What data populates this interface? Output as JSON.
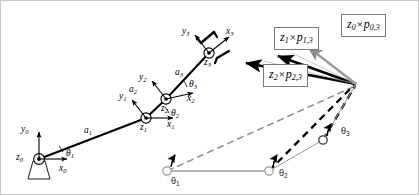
{
  "figure": {
    "width": 419,
    "height": 195,
    "background": "#ffffff",
    "border_color": "#c8c8c8"
  },
  "colors": {
    "link": "#000000",
    "axis": "#000000",
    "dashed_gray": "#8c8c8c",
    "dashed_black": "#000000",
    "box_border": "#7a7a7a",
    "joint_fill_open": "#ffffff",
    "joint_fill_solid": "#000000",
    "lower_chain": "#9a9a9a",
    "text": "#000000"
  },
  "frames": [
    {
      "name": "frame-0",
      "origin_label": "z",
      "origin_sub": "0",
      "x_label": "x",
      "x_sub": "0",
      "y_label": "y",
      "y_sub": "0",
      "z_symbol": "out-of-page",
      "mounted": true
    },
    {
      "name": "frame-1",
      "origin_label": "z",
      "origin_sub": "1",
      "x_label": "x",
      "x_sub": "1",
      "y_label": "y",
      "y_sub": "1",
      "z_symbol": "out-of-page",
      "mounted": false
    },
    {
      "name": "frame-2",
      "origin_label": "z",
      "origin_sub": "2",
      "x_label": "x",
      "x_sub": "2",
      "y_label": "y",
      "y_sub": "2",
      "z_symbol": "out-of-page",
      "mounted": false
    },
    {
      "name": "frame-3",
      "origin_label": "z",
      "origin_sub": "3",
      "x_label": "x",
      "x_sub": "3",
      "y_label": "y",
      "y_sub": "3",
      "z_symbol": "out-of-page",
      "mounted": false
    }
  ],
  "links": [
    {
      "name": "link-a1",
      "label": "a",
      "sub": "1"
    },
    {
      "name": "link-a2",
      "label": "a",
      "sub": "2"
    },
    {
      "name": "link-a3",
      "label": "a",
      "sub": "3"
    }
  ],
  "joint_angles_upper": [
    {
      "name": "theta-1-upper",
      "label": "θ",
      "sub": "1"
    },
    {
      "name": "theta-2-upper",
      "label": "θ",
      "sub": "2"
    },
    {
      "name": "theta-3-upper",
      "label": "θ",
      "sub": "3"
    }
  ],
  "joint_angles_lower": [
    {
      "name": "theta-1-lower",
      "label": "θ",
      "sub": "1"
    },
    {
      "name": "theta-2-lower",
      "label": "θ",
      "sub": "2"
    },
    {
      "name": "theta-3-lower",
      "label": "θ",
      "sub": "3"
    }
  ],
  "cross_product_boxes": [
    {
      "name": "cross-product-z1-p13",
      "z": "z",
      "z_sub": "1",
      "times": "×",
      "p": "p",
      "p_sub": "1,3",
      "text": "z1 × p1,3"
    },
    {
      "name": "cross-product-z0-p03",
      "z": "z",
      "z_sub": "0",
      "times": "×",
      "p": "p",
      "p_sub": "0,3",
      "text": "z0 × p0,3"
    },
    {
      "name": "cross-product-z2-p23",
      "z": "z",
      "z_sub": "2",
      "times": "×",
      "p": "p",
      "p_sub": "2,3",
      "text": "z2 × p2,3"
    }
  ],
  "geometry": {
    "upper_chain": {
      "origin_0": [
        38,
        158
      ],
      "origin_1": [
        145,
        117
      ],
      "origin_2": [
        165,
        98
      ],
      "origin_3": [
        208,
        52
      ],
      "tip": [
        224,
        36
      ]
    },
    "lower_chain": {
      "joint_1": [
        166,
        170
      ],
      "joint_2": [
        268,
        170
      ],
      "joint_3": [
        322,
        139
      ],
      "end": [
        355,
        83
      ]
    },
    "convergence_point": [
      355,
      83
    ]
  }
}
